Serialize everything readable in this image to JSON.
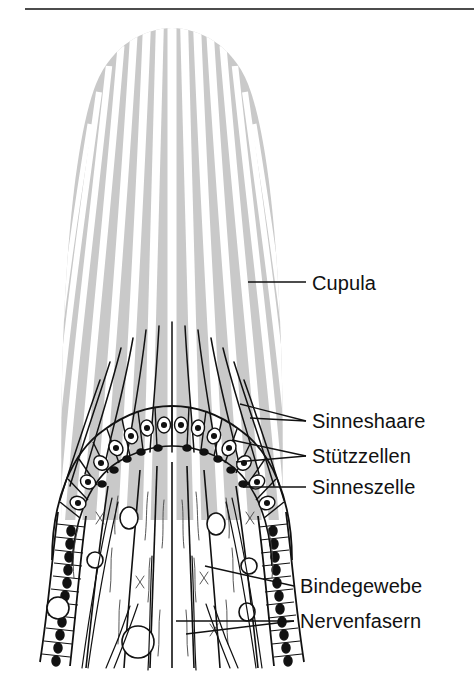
{
  "figure": {
    "top_rule": true,
    "background_color": "#ffffff",
    "ink_color": "#111111",
    "cupula_fill": "#c9c9c9",
    "cupula_channel_color": "#ffffff"
  },
  "labels": [
    {
      "id": "cupula",
      "text": "Cupula",
      "x": 312,
      "y": 290,
      "leader": {
        "from_x": 306,
        "from_y": 282,
        "to_x": 248,
        "to_y": 282
      }
    },
    {
      "id": "sinneshaare",
      "text": "Sinneshaare",
      "x": 312,
      "y": 428,
      "leader": {
        "from_x": 306,
        "from_y": 421,
        "to_x": 240,
        "to_y": 404
      }
    },
    {
      "id": "stuetzzellen",
      "text": "Stützzellen",
      "x": 312,
      "y": 463,
      "leader": {
        "from_x": 306,
        "from_y": 456,
        "to_x": 232,
        "to_y": 440
      }
    },
    {
      "id": "sinneszelle",
      "text": "Sinneszelle",
      "x": 312,
      "y": 494,
      "leader": {
        "from_x": 306,
        "from_y": 487,
        "to_x": 243,
        "to_y": 487
      }
    },
    {
      "id": "bindegewebe",
      "text": "Bindegewebe",
      "x": 300,
      "y": 593,
      "leader": {
        "from_x": 294,
        "from_y": 586,
        "to_x": 205,
        "to_y": 566
      }
    },
    {
      "id": "nervenfasern",
      "text": "Nervenfasern",
      "x": 300,
      "y": 628,
      "leader": {
        "from_x": 294,
        "from_y": 621,
        "to_x": 176,
        "to_y": 621
      }
    }
  ],
  "diagram": {
    "cupula": {
      "description": "gray striped dome-shaped gelatinous cap",
      "apex_y": 30,
      "base_y": 520,
      "top_half_width": 98,
      "base_half_width": 128,
      "stripe_count": 15
    },
    "sensory_hairs": {
      "description": "dark hair bundles rising from hair cells into cupula channels",
      "count": 13,
      "top_y": 318,
      "base_y": 450
    },
    "epithelium": {
      "description": "arched row of support cells and sensory cells with nuclei",
      "cell_count": 16
    },
    "flanking_epithelium": {
      "description": "columnar epithelial cell chains descending on both flanks",
      "cell_count_per_side": 14
    },
    "connective_tissue": {
      "description": "fibrous connective tissue core with vacuoles",
      "vacuole_count": 6
    },
    "nerve_fibers": {
      "description": "nerve fiber bundles running down through the base",
      "bundle_count": 6
    }
  }
}
